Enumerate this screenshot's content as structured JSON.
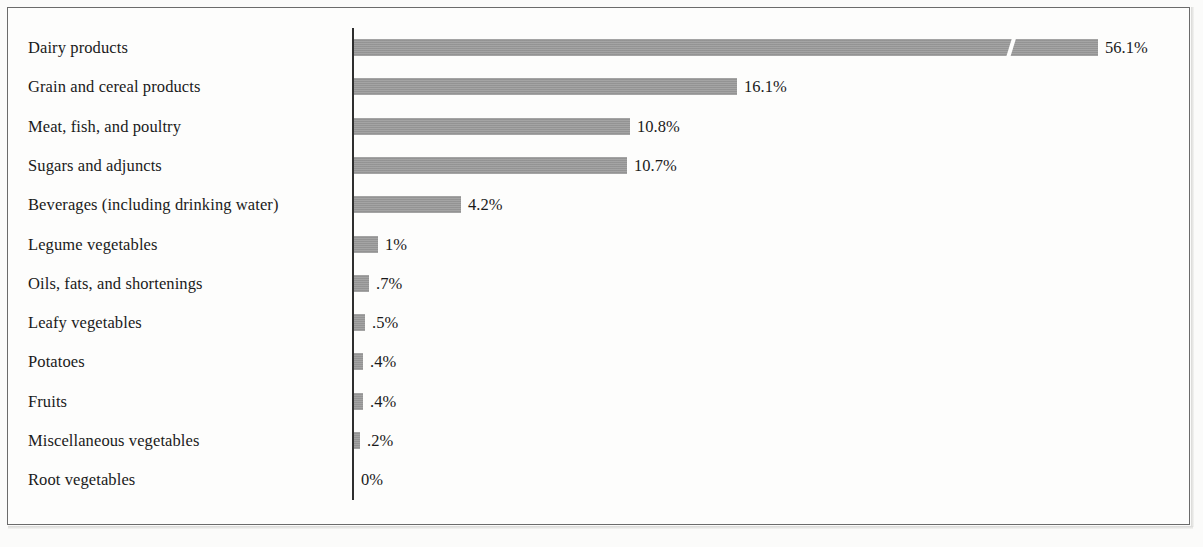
{
  "figure": {
    "axis_origin_label": "0%",
    "bar_color": "#9a9a9a",
    "axis_color": "#2e2e2e",
    "frame_color": "#6b6b6b"
  },
  "chart_data": {
    "type": "bar",
    "orientation": "horizontal",
    "title": "",
    "subtitle": "",
    "xlabel": "",
    "ylabel": "",
    "grid": false,
    "legend": null,
    "axis_break": {
      "present": true,
      "series_index": 0,
      "note": "scale break slash on the Dairy products bar"
    },
    "value_suffix": "%",
    "xlim": [
      0,
      56.1
    ],
    "categories": [
      "Dairy products",
      "Grain and cereal products",
      "Meat, fish, and poultry",
      "Sugars and adjuncts",
      "Beverages (including drinking water)",
      "Legume vegetables",
      "Oils, fats, and shortenings",
      "Leafy vegetables",
      "Potatoes",
      "Fruits",
      "Miscellaneous vegetables",
      "Root vegetables"
    ],
    "values": [
      56.1,
      16.1,
      10.8,
      10.7,
      4.2,
      1,
      0.7,
      0.5,
      0.4,
      0.4,
      0.2,
      0
    ],
    "value_labels": [
      "56.1%",
      "16.1%",
      "10.8%",
      "10.7%",
      "4.2%",
      "1%",
      ".7%",
      ".5%",
      ".4%",
      ".4%",
      ".2%",
      "0%"
    ],
    "bar_pixel_widths": [
      744,
      383,
      276,
      273,
      107,
      24,
      15,
      11,
      9,
      9,
      6,
      0
    ],
    "break_pixel_offset": 651
  }
}
